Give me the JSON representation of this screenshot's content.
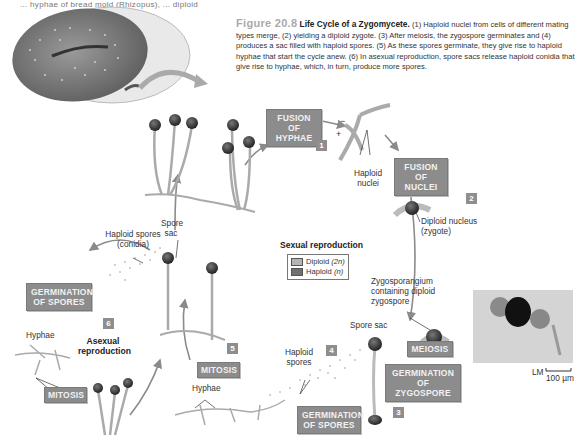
{
  "header_fragment": "... hyphae of bread mold (Rhizopus), ... diploid",
  "caption": {
    "figure_number": "Figure 20.8",
    "title": "Life Cycle of a Zygomycete.",
    "body": "(1) Haploid nuclei from cells of different mating types merge, (2) yielding a diploid zygote. (3) After meiosis, the zygospore germinates and (4) produces a sac filled with haploid spores. (5) As these spores germinate, they give rise to haploid hyphae that start the cycle anew. (6) In asexual reproduction, spore sacs release haploid conidia that give rise to hyphae, which, in turn, produce more spores."
  },
  "process_labels": {
    "fusion_of_hyphae": "FUSION OF HYPHAE",
    "fusion_of_nuclei": "FUSION OF NUCLEI",
    "meiosis": "MEIOSIS",
    "germination_of_zygospore": "GERMINATION OF ZYGOSPORE",
    "germination_of_spores_sexual": "GERMINATION OF SPORES",
    "mitosis_right": "MITOSIS",
    "germination_of_spores_asexual": "GERMINATION OF SPORES",
    "mitosis_left": "MITOSIS"
  },
  "step_numbers": [
    "1",
    "2",
    "3",
    "4",
    "5",
    "6"
  ],
  "annotations": {
    "haploid_nuclei": "Haploid nuclei",
    "diploid_nucleus": "Diploid nucleus (zygote)",
    "zygosporangium": "Zygosporangium containing diploid zygospore",
    "spore_sac_right": "Spore sac",
    "haploid_spores": "Haploid spores",
    "hyphae_right": "Hyphae",
    "spore_sac_left": "Spore sac",
    "haploid_spores_conidia": "Haploid spores (conidia)",
    "hyphae_left": "Hyphae",
    "plus_sign": "+",
    "minus_sign": "−"
  },
  "section_titles": {
    "sexual": "Sexual reproduction",
    "asexual": "Asexual reproduction"
  },
  "legend": {
    "items": [
      {
        "label": "Diploid",
        "ploidy": "(2n)",
        "color": "#b5b5b5"
      },
      {
        "label": "Haploid",
        "ploidy": "(n)",
        "color": "#707070"
      }
    ]
  },
  "micrograph": {
    "type_label": "LM",
    "scale": "100 µm"
  },
  "colors": {
    "label_box": "#8c8c8c",
    "label_text": "#f2f2f2",
    "arrow": "#888888"
  }
}
